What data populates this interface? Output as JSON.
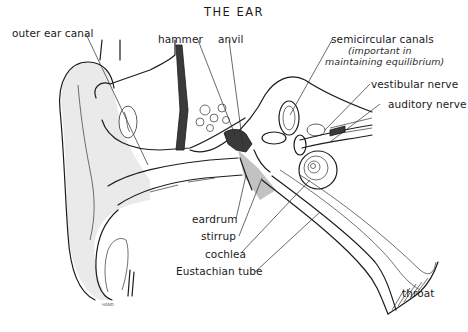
{
  "title": "THE EAR",
  "labels": {
    "outer_ear_canal": "outer ear canal",
    "hammer": "hammer",
    "anvil": "anvil",
    "semicircular_canals": "semicircular canals",
    "semicircular_note_1": "(important in",
    "semicircular_note_2": "maintaining equilibrium)",
    "vestibular_nerve": "vestibular nerve",
    "auditory_nerve": "auditory nerve",
    "eardrum": "eardrum",
    "stirrup": "stirrup",
    "cochlea": "cochlea",
    "eustachian_tube": "Eustachian tube",
    "throat": "throat"
  },
  "signature": "HAND"
}
